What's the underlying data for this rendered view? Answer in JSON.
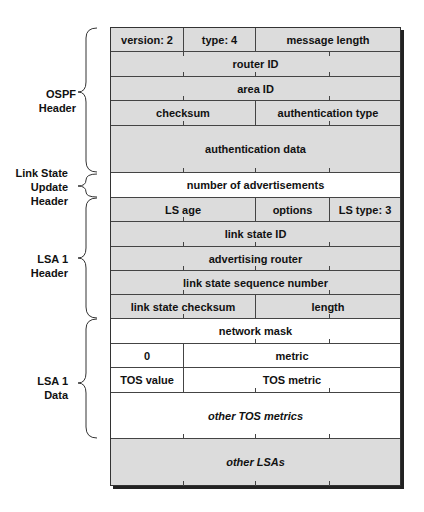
{
  "sections": [
    {
      "label": "OSPF\nHeader",
      "lines": [
        "OSPF",
        "Header"
      ]
    },
    {
      "label": "Link State Update Header",
      "lines": [
        "Link State",
        "Update",
        "Header"
      ]
    },
    {
      "label": "LSA 1 Header",
      "lines": [
        "LSA 1",
        "Header"
      ]
    },
    {
      "label": "LSA 1 Data",
      "lines": [
        "LSA 1",
        "Data"
      ]
    }
  ],
  "rows": [
    {
      "cells": [
        "version: 2",
        "type: 4",
        "message length"
      ]
    },
    {
      "cells": [
        "router ID"
      ]
    },
    {
      "cells": [
        "area ID"
      ]
    },
    {
      "cells": [
        "checksum",
        "authentication type"
      ]
    },
    {
      "cells": [
        "authentication data"
      ]
    },
    {
      "cells": [
        "number of advertisements"
      ]
    },
    {
      "cells": [
        "LS age",
        "options",
        "LS type: 3"
      ]
    },
    {
      "cells": [
        "link state ID"
      ]
    },
    {
      "cells": [
        "advertising router"
      ]
    },
    {
      "cells": [
        "link state sequence number"
      ]
    },
    {
      "cells": [
        "link state checksum",
        "length"
      ]
    },
    {
      "cells": [
        "network mask"
      ]
    },
    {
      "cells": [
        "0",
        "metric"
      ]
    },
    {
      "cells": [
        "TOS value",
        "TOS metric"
      ]
    },
    {
      "cells": [
        "other TOS metrics"
      ]
    },
    {
      "cells": [
        "other LSAs"
      ]
    }
  ],
  "colors": {
    "grey_fill": "#dcdcdc",
    "white_fill": "#ffffff",
    "line": "#444444"
  }
}
